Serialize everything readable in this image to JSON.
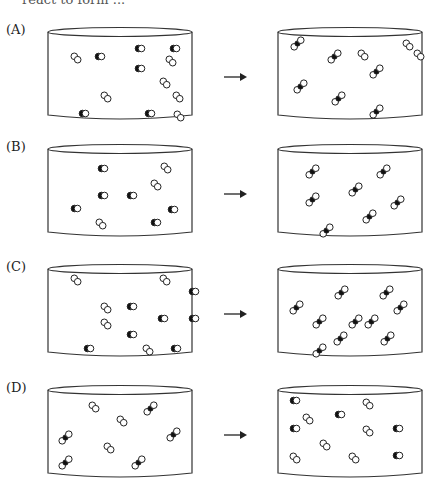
{
  "header": {
    "cut_text": "react to form ..."
  },
  "arrow_glyph": "→",
  "legend": {
    "CO": "black-white diatomic (carbon monoxide)",
    "O2": "white-white diatomic (oxygen)",
    "CO2": "white-black-white triatomic (carbon dioxide)"
  },
  "panels": [
    {
      "label": "(A)",
      "top": 20,
      "before": [
        [
          "CO",
          92,
          22
        ],
        [
          "CO",
          127,
          22
        ],
        [
          "O2",
          28,
          30
        ],
        [
          "CO",
          52,
          30
        ],
        [
          "O2",
          123,
          33
        ],
        [
          "CO",
          92,
          42
        ],
        [
          "O2",
          117,
          55
        ],
        [
          "O2",
          58,
          69
        ],
        [
          "O2",
          130,
          69
        ],
        [
          "CO",
          36,
          87
        ],
        [
          "CO",
          102,
          87
        ],
        [
          "O2",
          131,
          88
        ]
      ],
      "after": [
        [
          "CO2",
          18,
          14
        ],
        [
          "CO2",
          55,
          27
        ],
        [
          "O2",
          85,
          27
        ],
        [
          "O2",
          130,
          17
        ],
        [
          "O2",
          141,
          27
        ],
        [
          "CO2",
          97,
          42
        ],
        [
          "CO2",
          21,
          57
        ],
        [
          "CO2",
          59,
          69
        ],
        [
          "CO2",
          97,
          82
        ]
      ]
    },
    {
      "label": "(B)",
      "top": 137,
      "before": [
        [
          "CO",
          55,
          25
        ],
        [
          "O2",
          118,
          23
        ],
        [
          "O2",
          108,
          40
        ],
        [
          "CO",
          55,
          52
        ],
        [
          "CO",
          84,
          52
        ],
        [
          "CO",
          28,
          65
        ],
        [
          "CO",
          125,
          66
        ],
        [
          "O2",
          53,
          79
        ],
        [
          "CO",
          108,
          79
        ]
      ],
      "after": [
        [
          "CO2",
          33,
          25
        ],
        [
          "CO2",
          104,
          25
        ],
        [
          "CO2",
          76,
          43
        ],
        [
          "CO2",
          33,
          53
        ],
        [
          "CO2",
          118,
          56
        ],
        [
          "CO2",
          90,
          70
        ],
        [
          "CO2",
          47,
          84
        ]
      ]
    },
    {
      "label": "(C)",
      "top": 257,
      "before": [
        [
          "O2",
          28,
          15
        ],
        [
          "O2",
          117,
          15
        ],
        [
          "CO",
          146,
          28
        ],
        [
          "O2",
          58,
          43
        ],
        [
          "CO",
          84,
          43
        ],
        [
          "CO",
          115,
          55
        ],
        [
          "CO",
          146,
          55
        ],
        [
          "O2",
          58,
          59
        ],
        [
          "CO",
          84,
          71
        ],
        [
          "CO",
          41,
          85
        ],
        [
          "O2",
          100,
          85
        ],
        [
          "CO",
          128,
          85
        ]
      ],
      "after": [
        [
          "CO2",
          62,
          26
        ],
        [
          "CO2",
          107,
          26
        ],
        [
          "CO2",
          17,
          41
        ],
        [
          "CO2",
          121,
          41
        ],
        [
          "CO2",
          40,
          55
        ],
        [
          "CO2",
          76,
          55
        ],
        [
          "CO2",
          92,
          55
        ],
        [
          "CO2",
          61,
          72
        ],
        [
          "CO2",
          108,
          72
        ],
        [
          "CO2",
          40,
          84
        ]
      ]
    },
    {
      "label": "(D)",
      "top": 378,
      "before": [
        [
          "O2",
          46,
          21
        ],
        [
          "CO2",
          101,
          21
        ],
        [
          "O2",
          74,
          35
        ],
        [
          "CO2",
          16,
          50
        ],
        [
          "CO2",
          124,
          47
        ],
        [
          "O2",
          61,
          62
        ],
        [
          "CO2",
          16,
          75
        ],
        [
          "CO2",
          89,
          75
        ]
      ],
      "after": [
        [
          "CO",
          17,
          16
        ],
        [
          "O2",
          90,
          18
        ],
        [
          "O2",
          30,
          33
        ],
        [
          "CO",
          62,
          30
        ],
        [
          "CO",
          17,
          44
        ],
        [
          "O2",
          90,
          45
        ],
        [
          "CO",
          120,
          44
        ],
        [
          "O",
          0,
          0
        ],
        [
          "O2",
          47,
          59
        ],
        [
          "O2",
          17,
          72
        ],
        [
          "O2",
          76,
          72
        ],
        [
          "CO",
          120,
          71
        ]
      ]
    }
  ]
}
